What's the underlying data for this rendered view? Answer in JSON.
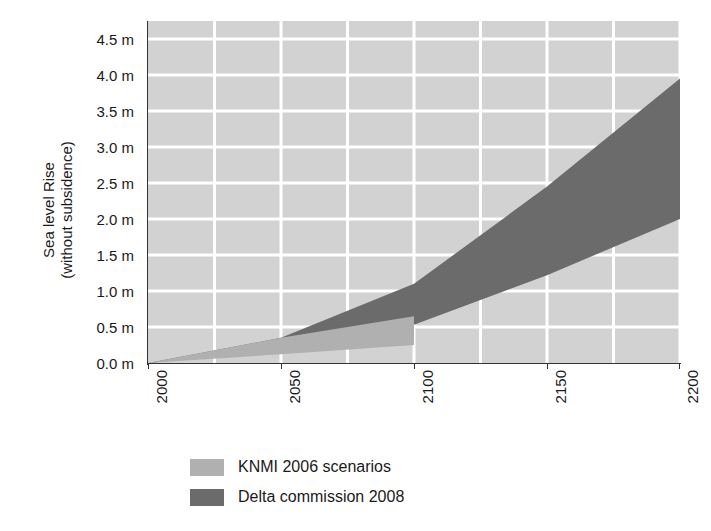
{
  "chart_data": {
    "type": "area",
    "title": "",
    "xlabel": "",
    "ylabel": "Sea level Rise (without subsidence)",
    "ylabel_line1": "Sea level Rise",
    "ylabel_line2": "(without subsidence)",
    "xlim": [
      2000,
      2200
    ],
    "ylim": [
      0.0,
      4.75
    ],
    "grid": true,
    "grid_color": "#ffffff",
    "plot_background": "#d2d2d2",
    "x_ticks": [
      2000,
      2050,
      2100,
      2150,
      2200
    ],
    "x_tick_labels": [
      "2000",
      "2050",
      "2100",
      "2150",
      "2200"
    ],
    "y_ticks": [
      0.0,
      0.5,
      1.0,
      1.5,
      2.0,
      2.5,
      3.0,
      3.5,
      4.0,
      4.5
    ],
    "y_tick_labels": [
      "0.0 m",
      "0.5 m",
      "1.0 m",
      "1.5 m",
      "2.0 m",
      "2.5 m",
      "3.0 m",
      "3.5 m",
      "4.0 m",
      "4.5 m"
    ],
    "legend_position": "below-plot",
    "series": [
      {
        "name": "KNMI 2006 scenarios",
        "color": "#b0b0b0",
        "x": [
          2000,
          2050,
          2100
        ],
        "upper": [
          0.0,
          0.35,
          0.65
        ],
        "lower": [
          0.0,
          0.12,
          0.25
        ]
      },
      {
        "name": "Delta commission 2008",
        "color": "#6b6b6b",
        "x": [
          2000,
          2050,
          2100,
          2150,
          2200
        ],
        "upper": [
          0.0,
          0.35,
          1.1,
          2.45,
          3.95
        ],
        "lower": [
          0.0,
          0.18,
          0.53,
          1.22,
          2.0
        ]
      }
    ]
  },
  "legend": {
    "items": [
      {
        "label": "KNMI 2006 scenarios",
        "color": "#b0b0b0"
      },
      {
        "label": "Delta commission 2008",
        "color": "#6b6b6b"
      }
    ]
  },
  "axes": {
    "y_title_line1": "Sea level Rise",
    "y_title_line2": "(without subsidence)"
  }
}
